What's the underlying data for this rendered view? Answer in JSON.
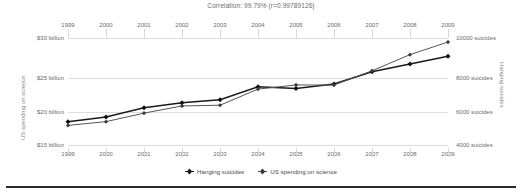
{
  "chart_data": {
    "type": "line",
    "title": "Correlation: 99.79% (r=0.99789126)",
    "x": [
      1999,
      2000,
      2001,
      2002,
      2003,
      2004,
      2005,
      2006,
      2007,
      2008,
      2009
    ],
    "xtick_labels": [
      "1999",
      "2000",
      "2001",
      "2002",
      "2003",
      "2004",
      "2005",
      "2006",
      "2007",
      "2008",
      "2009"
    ],
    "grid": true,
    "legend_position": "bottom",
    "series": [
      {
        "name": "Hanging suicides",
        "axis": "right",
        "marker": "filled-diamond",
        "color": "#1a1a1a",
        "values": [
          5427,
          5688,
          6198,
          6462,
          6635,
          7336,
          7248,
          7491,
          8161,
          8578,
          9000
        ]
      },
      {
        "name": "US spending on science",
        "axis": "left",
        "marker": "filled-diamond",
        "color": "#555555",
        "values": [
          18.079,
          18.594,
          19.753,
          20.734,
          20.831,
          23.029,
          23.597,
          23.584,
          25.525,
          27.731,
          29.449
        ]
      }
    ],
    "left_axis": {
      "label": "US spending on science",
      "tick_labels": [
        "$30 billion",
        "$25 billion",
        "$20 billion",
        "$15 billion"
      ],
      "tick_values": [
        30,
        25,
        20,
        15
      ],
      "ylim": [
        15,
        30
      ]
    },
    "right_axis": {
      "label": "Hanging suicides",
      "tick_labels": [
        "10000 suicides",
        "8000 suicides",
        "6000 suicides",
        "4000 suicides"
      ],
      "tick_values": [
        10000,
        8000,
        6000,
        4000
      ],
      "ylim": [
        4000,
        10000
      ]
    }
  }
}
